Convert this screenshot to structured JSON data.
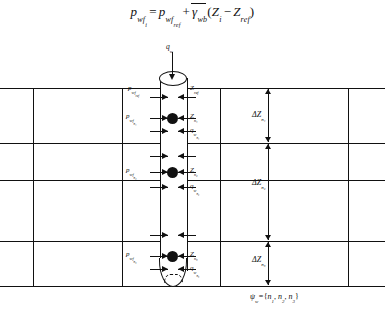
{
  "figure": {
    "equation": {
      "lhs_p": "p",
      "lhs_sub": "wf",
      "lhs_sub_sub": "i",
      "eq": "=",
      "rhs_p": "p",
      "rhs_sub": "wf",
      "rhs_sub_sub": "ref",
      "plus": "+",
      "gamma": "γ",
      "gamma_sub": "wb",
      "open_paren": "(",
      "Z1": "Z",
      "Z1_sub": "i",
      "minus": "−",
      "Z2": "Z",
      "Z2_sub": "ref",
      "close_paren": ")"
    },
    "inflow_label": {
      "q": "q",
      "sub": "w"
    },
    "reference_level": {
      "pressure": {
        "p": "p",
        "sub": "wf",
        "sub_sub": "ref"
      },
      "depth": {
        "Z": "Z",
        "sub": "ref"
      }
    },
    "perforations": [
      {
        "id": "n1",
        "pressure": {
          "p": "p",
          "sub": "wf",
          "sub_sub": "n₁"
        },
        "depth": {
          "Z": "Z",
          "sub": "n₁"
        },
        "rate": {
          "q": "q",
          "sub": "w",
          "sub_sub": "n₁"
        }
      },
      {
        "id": "n2",
        "pressure": {
          "p": "p",
          "sub": "wf",
          "sub_sub": "n₂"
        },
        "depth": {
          "Z": "Z",
          "sub": "n₂"
        },
        "rate": {
          "q": "q",
          "sub": "w",
          "sub_sub": "n₂"
        }
      },
      {
        "id": "n3",
        "pressure": {
          "p": "p",
          "sub": "wf",
          "sub_sub": "n₃"
        },
        "depth": {
          "Z": "Z",
          "sub": "n₃"
        },
        "rate": {
          "q": "q",
          "sub": "w",
          "sub_sub": "n₃"
        }
      }
    ],
    "depth_increments": [
      {
        "delta": "Δ",
        "Z": "Z",
        "sub": "n₁"
      },
      {
        "delta": "Δ",
        "Z": "Z",
        "sub": "n₂"
      },
      {
        "delta": "Δ",
        "Z": "Z",
        "sub": "n₃"
      }
    ],
    "completion_set": {
      "psi": "ψ",
      "psi_sub": "w",
      "equals": "=",
      "open": "{",
      "m1": "n",
      "m1_sub": "1",
      "c1": ",",
      "m2": "n",
      "m2_sub": "2",
      "c2": ",",
      "m3": "n",
      "m3_sub": "3",
      "close": "}"
    },
    "colors": {
      "ink": "#111111",
      "paper": "#ffffff"
    }
  }
}
